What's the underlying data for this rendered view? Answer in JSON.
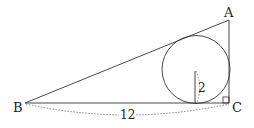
{
  "diagram": {
    "type": "geometry",
    "vertices": {
      "A": {
        "label": "A"
      },
      "B": {
        "label": "B"
      },
      "C": {
        "label": "C"
      }
    },
    "right_angle_at": "C",
    "measurements": {
      "BC": "12",
      "radius": "2"
    },
    "colors": {
      "stroke": "#333333",
      "background": "#ffffff"
    }
  }
}
